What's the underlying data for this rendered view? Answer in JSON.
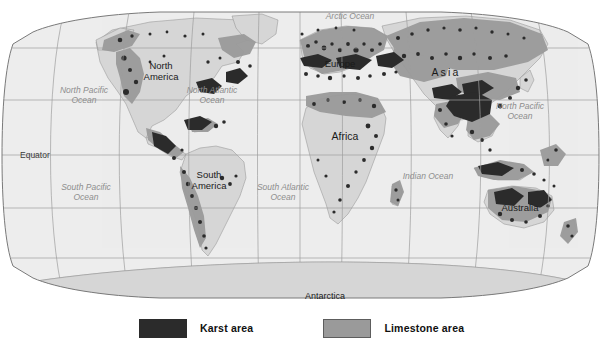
{
  "figure": {
    "type": "thematic-world-map",
    "title": "",
    "projection": "robinson-like",
    "background_color": "#ffffff"
  },
  "map": {
    "land_color": "#d6d6d6",
    "ocean_color": "#ededed",
    "graticule_color": "#9e9e9e",
    "border_color": "#7a7a7a",
    "karst_color": "#2b2b2b",
    "limestone_color": "#9a9a9a",
    "oceans": [
      {
        "name": "arctic-ocean",
        "label": "Arctic Ocean",
        "x": 350,
        "y": 12,
        "w": 70
      },
      {
        "name": "north-pacific-west",
        "label": "North Pacific\nOcean",
        "x": 84,
        "y": 86,
        "w": 72
      },
      {
        "name": "north-atlantic",
        "label": "North Atlantic\nOcean",
        "x": 212,
        "y": 86,
        "w": 76
      },
      {
        "name": "north-pacific-east",
        "label": "North Pacific\nOcean",
        "x": 520,
        "y": 102,
        "w": 70
      },
      {
        "name": "south-pacific",
        "label": "South Pacific\nOcean",
        "x": 86,
        "y": 183,
        "w": 72
      },
      {
        "name": "south-atlantic",
        "label": "South Atlantic\nOcean",
        "x": 283,
        "y": 183,
        "w": 76
      },
      {
        "name": "indian-ocean",
        "label": "Indian Ocean",
        "x": 428,
        "y": 172,
        "w": 62
      }
    ],
    "continents": [
      {
        "name": "north-america",
        "label": "North\nAmerica",
        "x": 161,
        "y": 61,
        "w": 54,
        "size": "normal",
        "spaced": false
      },
      {
        "name": "south-america",
        "label": "South\nAmerica",
        "x": 209,
        "y": 170,
        "w": 52,
        "size": "normal",
        "spaced": false
      },
      {
        "name": "europe",
        "label": "Europe",
        "x": 340,
        "y": 59,
        "w": 46,
        "size": "normal",
        "spaced": false
      },
      {
        "name": "africa",
        "label": "Africa",
        "x": 345,
        "y": 131,
        "w": 46,
        "size": "big",
        "spaced": false
      },
      {
        "name": "asia",
        "label": "Asia",
        "x": 446,
        "y": 67,
        "w": 48,
        "size": "big",
        "spaced": true
      },
      {
        "name": "australia",
        "label": "Australia",
        "x": 520,
        "y": 203,
        "w": 52,
        "size": "normal",
        "spaced": false
      },
      {
        "name": "antarctica",
        "label": "Antarctica",
        "x": 325,
        "y": 291,
        "w": 60,
        "size": "normal",
        "spaced": false
      }
    ],
    "reference_lines": [
      {
        "name": "equator",
        "label": "Equator",
        "x": 20,
        "y": 150
      }
    ]
  },
  "legend": {
    "items": [
      {
        "name": "karst",
        "label": "Karst area",
        "color": "#2b2b2b"
      },
      {
        "name": "limestone",
        "label": "Limestone area",
        "color": "#9a9a9a"
      }
    ]
  }
}
